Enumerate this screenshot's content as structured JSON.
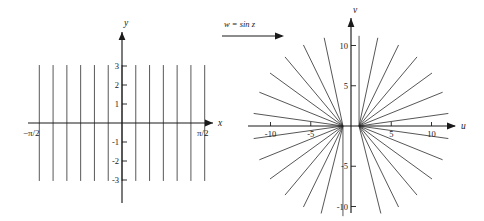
{
  "figure": {
    "caption_map_label": "w = sin z",
    "arrow": "map-arrow-right"
  },
  "left_panel": {
    "name": "z-plane",
    "x_axis_label": "x",
    "y_axis_label": "y",
    "x_left_label": "−π/2",
    "x_right_label": "π/2",
    "y_ticks": [
      "3",
      "2",
      "1",
      "-1",
      "-2",
      "-3"
    ],
    "y_tick_values": [
      3,
      2,
      1,
      -1,
      -2,
      -3
    ],
    "grid_line_count": 13
  },
  "right_panel": {
    "name": "w-plane",
    "x_axis_label": "u",
    "y_axis_label": "v",
    "u_ticks": [
      "-10",
      "-5",
      "5",
      "10"
    ],
    "u_tick_values": [
      -10,
      -5,
      5,
      10
    ],
    "v_ticks": [
      "10",
      "5",
      "-5",
      "-10"
    ],
    "v_tick_values": [
      10,
      5,
      -5,
      -10
    ],
    "ray_count": 24
  },
  "chart_data": {
    "type": "line",
    "title": "",
    "panels": [
      {
        "id": "z-plane",
        "type": "line",
        "xlabel": "x",
        "ylabel": "y",
        "xlim": [
          -1.5707963,
          1.5707963
        ],
        "ylim": [
          -3.2,
          3.2
        ],
        "xticks": [
          -1.5707963,
          1.5707963
        ],
        "xticklabels": [
          "−π/2",
          "π/2"
        ],
        "yticks": [
          3,
          2,
          1,
          -1,
          -2,
          -3
        ],
        "yticklabels": [
          "3",
          "2",
          "1",
          "-1",
          "-2",
          "-3"
        ],
        "grid": false,
        "series": [
          {
            "name": "vertical lines x = const",
            "x_values": [
              -1.4137167,
              -1.1780972,
              -0.9424778,
              -0.7068583,
              -0.4712389,
              -0.2356194,
              0.0,
              0.2356194,
              0.4712389,
              0.7068583,
              0.9424778,
              1.1780972,
              1.4137167
            ],
            "y_extent": [
              -3.05,
              3.05
            ]
          }
        ]
      },
      {
        "id": "w-plane",
        "type": "line",
        "xlabel": "u",
        "ylabel": "v",
        "xlim": [
          -12,
          12
        ],
        "ylim": [
          -11.5,
          11.5
        ],
        "xticks": [
          -10,
          -5,
          5,
          10
        ],
        "xticklabels": [
          "-10",
          "-5",
          "5",
          "10"
        ],
        "yticks": [
          10,
          5,
          -5,
          -10
        ],
        "yticklabels": [
          "10",
          "5",
          "-5",
          "-10"
        ],
        "grid": false,
        "series": [
          {
            "name": "hyperbola branches (images of vertical lines)",
            "description": "Rays emanating from foci at u = -1 and u = +1",
            "ray_angles_deg": [
              8,
              22,
              36,
              50,
              64,
              78,
              90,
              102,
              116,
              130,
              144,
              158,
              172,
              188,
              202,
              216,
              230,
              244,
              256,
              270,
              284,
              296,
              310,
              324,
              338,
              352
            ],
            "radius": 11.2
          }
        ]
      }
    ]
  }
}
